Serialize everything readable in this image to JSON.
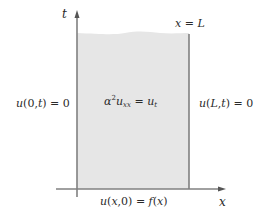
{
  "diagram": {
    "type": "heat-equation-boundary-value-problem",
    "axes": {
      "vertical_label": "t",
      "horizontal_label": "x"
    },
    "labels": {
      "right_boundary_top": "x = L",
      "left_boundary_condition": "u(0, t) = 0",
      "pde": "α²uₓₓ = uₜ",
      "right_boundary_condition": "u(L, t) = 0",
      "initial_condition": "u(x, 0) = f(x)"
    },
    "colors": {
      "region_fill": "#e6e6e6",
      "axis_line": "#7a7a7a",
      "text": "#2a2a2a"
    }
  }
}
